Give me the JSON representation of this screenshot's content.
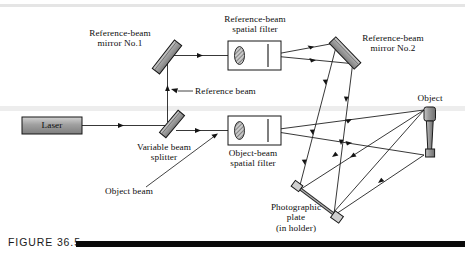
{
  "figure": {
    "caption_id": "FIGURE 36.5",
    "domain": "optics-holography-setup",
    "background": "#ffffff",
    "ink": "#111111",
    "component_fill": "#9a9a9a",
    "component_fill_light": "#b8b8b8",
    "bar_color": "#0a0a0a"
  },
  "labels": {
    "laser": "Laser",
    "reference_beam_mirror_1": "Reference-beam\nmirror No.1",
    "reference_beam_mirror_2": "Reference-beam\nmirror No.2",
    "reference_beam_spatial_filter": "Reference-beam\nspatial filter",
    "object_beam_spatial_filter": "Object-beam\nspatial filter",
    "reference_beam": "Reference beam",
    "object_beam": "Object beam",
    "variable_beam_splitter": "Variable beam\nsplitter",
    "photographic_plate": "Photographic\nplate\n(in holder)",
    "object": "Object"
  },
  "components": [
    {
      "name": "laser-source",
      "label": "Laser",
      "x": 22,
      "y": 117,
      "w": 60,
      "h": 17
    },
    {
      "name": "variable-beam-splitter",
      "label": "Variable beam splitter",
      "cx": 172,
      "cy": 124,
      "angle": -50
    },
    {
      "name": "reference-beam-mirror-1",
      "label": "Reference-beam mirror No.1",
      "cx": 168,
      "cy": 57,
      "angle": -50
    },
    {
      "name": "reference-beam-mirror-2",
      "label": "Reference-beam mirror No.2",
      "cx": 345,
      "cy": 53,
      "angle": 43
    },
    {
      "name": "reference-beam-spatial-filter",
      "label": "Reference-beam spatial filter",
      "x": 228,
      "y": 41,
      "w": 53,
      "h": 29
    },
    {
      "name": "object-beam-spatial-filter",
      "label": "Object-beam spatial filter",
      "x": 228,
      "y": 116,
      "w": 53,
      "h": 29
    },
    {
      "name": "photographic-plate",
      "label": "Photographic plate (in holder)",
      "x1": 297,
      "y1": 187,
      "x2": 337,
      "y2": 216
    },
    {
      "name": "object",
      "label": "Object",
      "x": 424,
      "y": 107,
      "w": 11,
      "h": 50
    }
  ],
  "beams": [
    {
      "name": "laser-to-splitter",
      "from": "laser-source",
      "to": "variable-beam-splitter"
    },
    {
      "name": "splitter-to-mirror1",
      "from": "variable-beam-splitter",
      "to": "reference-beam-mirror-1"
    },
    {
      "name": "mirror1-to-reference-filter",
      "from": "reference-beam-mirror-1",
      "to": "reference-beam-spatial-filter"
    },
    {
      "name": "reference-filter-to-mirror2",
      "from": "reference-beam-spatial-filter",
      "to": "reference-beam-mirror-2"
    },
    {
      "name": "mirror2-to-plate",
      "from": "reference-beam-mirror-2",
      "to": "photographic-plate"
    },
    {
      "name": "splitter-to-object-filter",
      "from": "variable-beam-splitter",
      "to": "object-beam-spatial-filter"
    },
    {
      "name": "object-filter-to-object",
      "from": "object-beam-spatial-filter",
      "to": "object"
    },
    {
      "name": "object-to-plate",
      "from": "object",
      "to": "photographic-plate"
    }
  ]
}
